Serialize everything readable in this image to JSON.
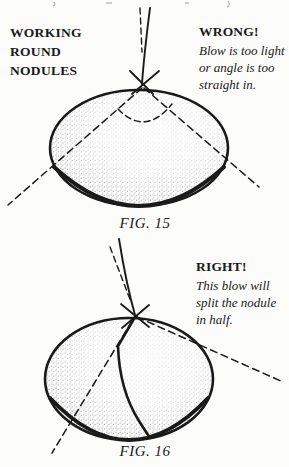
{
  "colors": {
    "ink": "#1a1a1a",
    "paper": "#fcfcfa",
    "stipple": "#242424"
  },
  "figure15": {
    "heading": "WORKING\nROUND\nNODULES",
    "verdict": "WRONG!",
    "caption": "Blow is too light\nor angle is too\nstraight in.",
    "fig_label": "FIG. 15"
  },
  "figure16": {
    "verdict": "RIGHT!",
    "caption": "This blow will\nsplit the nodule\nin half.",
    "fig_label": "FIG. 16"
  }
}
